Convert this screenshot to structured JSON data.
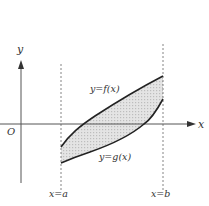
{
  "diagram": {
    "type": "area-between-curves",
    "axes": {
      "x_label": "x",
      "y_label": "y",
      "origin_label": "O"
    },
    "curves": [
      {
        "name": "upper",
        "label": "y=f(x)"
      },
      {
        "name": "lower",
        "label": "y=g(x)"
      }
    ],
    "bounds": [
      {
        "name": "left",
        "label": "x=a"
      },
      {
        "name": "right",
        "label": "x=b"
      }
    ],
    "colors": {
      "axis": "#444444",
      "curve": "#222222",
      "fill": "#d9d9d9",
      "dash": "#666666"
    }
  }
}
